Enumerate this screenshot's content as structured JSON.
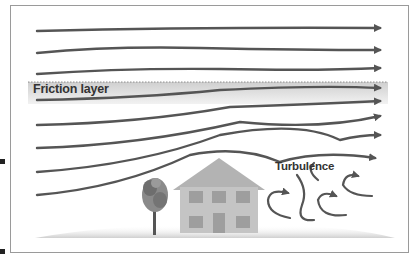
{
  "diagram": {
    "labels": {
      "friction_layer": "Friction layer",
      "turbulence": "Turbulence"
    },
    "elements": [
      "wind streamlines (8)",
      "friction layer band",
      "tree",
      "two-story house",
      "turbulence eddies",
      "ground shading"
    ],
    "colors": {
      "streamline": "#555555",
      "friction_band": "#d9d9d9",
      "house": "#bdbdbd",
      "window": "#9e9e9e",
      "frame": "#9a9a9a",
      "label": "#333333"
    }
  }
}
